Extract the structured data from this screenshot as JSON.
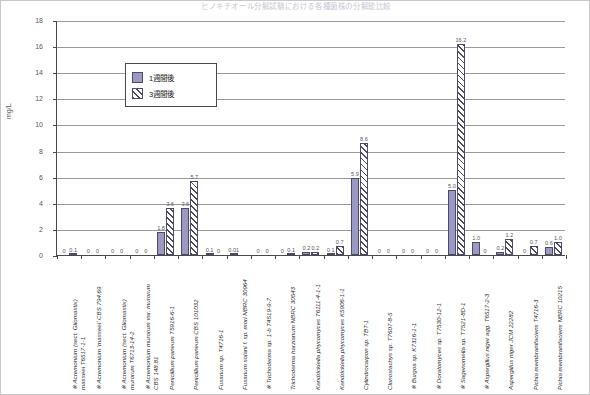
{
  "chart": {
    "title": "ヒノキチオール分解試験における各種菌株の分解能比較",
    "ylabel": "mg/L",
    "legend": [
      {
        "key": "week1",
        "label": "1週間後"
      },
      {
        "key": "week3",
        "label": "3週間後"
      }
    ]
  },
  "chart_data": {
    "type": "bar",
    "title": "ヒノキチオール分解試験における各種菌株の分解能比較",
    "xlabel": "",
    "ylabel": "mg/L",
    "ylim": [
      0,
      18
    ],
    "yticks": [
      0,
      2,
      4,
      6,
      8,
      10,
      12,
      14,
      16,
      18
    ],
    "grid": true,
    "legend_position": "upper-left-inside",
    "categories": [
      "※ Acremonium (sect. Gliomastix) masseei T6517-1-1",
      "※ Acremonium 'masseei' CBS 794.69",
      "※ Acremonium (sect. Gliomastix) murorum T6713-14-2",
      "※ Acremonium murorum var. murorum CBS 148.81",
      "Penicillium paneum T5916-6-1",
      "Penicillium paneum CBS 101032",
      "Fusarium sp. T4716-1",
      "Fusarium solani f. sp. mori NBRC 30964",
      "※ Trichoderma sp. 1-b T4519-9-7",
      "Trichoderma harzianum NBRC 30543",
      "Kendrickiella phycomyces T6111-4-1-1",
      "Kendrickiella phycomyces K5906-1-1",
      "Cylindrocarpon sp. TBT-1",
      "Clonostachys sp. T7607-8-5",
      "※ Burgoa sp. K7316-1-1",
      "※ Doratomyces sp. T7530-12-1",
      "※ Sagenomella sp. T7521-8D-1",
      "※ Aspergillus niger agg. T6517-2-3",
      "Aspergillus niger JCM 22282",
      "Pichia membranifaciens T4716-3",
      "Pichia membranifaciens NBRC 10215"
    ],
    "categories_display": [
      [
        "※ Acremonium (sect. Gliomastix)",
        "masseei T6517-1-1"
      ],
      [
        "※ Acremonium 'masseei' CBS 794.69"
      ],
      [
        "※ Acremonium (sect. Gliomastix)",
        "murorum T6713-14-2"
      ],
      [
        "※ Acremonium murorum var. murorum",
        "CBS 148.81"
      ],
      [
        "Penicillium paneum T5916-6-1"
      ],
      [
        "Penicillium paneum CBS 101032"
      ],
      [
        "Fusarium sp. T4716-1"
      ],
      [
        "Fusarium solani f. sp. mori NBRC 30964"
      ],
      [
        "※ Trichoderma sp. 1-b T4519-9-7"
      ],
      [
        "Trichoderma harzianum NBRC 30543"
      ],
      [
        "Kendrickiella phycomyces T6111-4-1-1"
      ],
      [
        "Kendrickiella phycomyces K5906-1-1"
      ],
      [
        "Cylindrocarpon sp. TBT-1"
      ],
      [
        "Clonostachys sp. T7607-8-5"
      ],
      [
        "※ Burgoa sp. K7316-1-1"
      ],
      [
        "※ Doratomyces sp. T7530-12-1"
      ],
      [
        "※ Sagenomella sp. T7521-8D-1"
      ],
      [
        "※ Aspergillus niger agg. T6517-2-3"
      ],
      [
        "Aspergillus niger JCM 22282"
      ],
      [
        "Pichia membranifaciens T4716-3"
      ],
      [
        "Pichia membranifaciens NBRC 10215"
      ]
    ],
    "series": [
      {
        "name": "1週間後",
        "color": "#9b98c4",
        "values": [
          0,
          0,
          0,
          0,
          1.8,
          3.6,
          0.1,
          0.1,
          0,
          0,
          0,
          0.2,
          0.1,
          5.9,
          0,
          0,
          5.0,
          1.0,
          0.2,
          0,
          0.6
        ],
        "labels": [
          "0",
          "0",
          "0",
          "0",
          "1.8",
          "3.6",
          "0.1",
          "0.01",
          "0",
          "0",
          "0.2",
          "0.1",
          "5.9",
          "0",
          "0",
          "5.0",
          "1.0",
          "0.2",
          "0",
          "0.6",
          ""
        ]
      },
      {
        "name": "3週間後",
        "color": "#4c4a68",
        "values": [
          0.1,
          0,
          0,
          0,
          3.6,
          5.7,
          0,
          0,
          0,
          0.1,
          0.2,
          0.7,
          8.6,
          0,
          0,
          16.2,
          0,
          1.2,
          0.7,
          1.0,
          0
        ],
        "labels": [
          "0.1",
          "0",
          "0",
          "0",
          "3.6",
          "5.7",
          "0",
          "0",
          "0.01",
          "0.1",
          "0.2",
          "0.7",
          "8.6",
          "0",
          "0",
          "16.2",
          "0",
          "1.2",
          "0.7",
          "1.0",
          ""
        ]
      }
    ],
    "points": [
      {
        "category": "※ Acremonium (sect. Gliomastix) masseei T6517-1-1",
        "week1": 0,
        "week1_label": "0",
        "week3": 0.1,
        "week3_label": "0.1"
      },
      {
        "category": "※ Acremonium 'masseei' CBS 794.69",
        "week1": 0,
        "week1_label": "0",
        "week3": 0,
        "week3_label": "0"
      },
      {
        "category": "※ Acremonium (sect. Gliomastix) murorum T6713-14-2",
        "week1": 0,
        "week1_label": "0",
        "week3": 0,
        "week3_label": "0"
      },
      {
        "category": "※ Acremonium murorum var. murorum CBS 148.81",
        "week1": 0,
        "week1_label": "0",
        "week3": 0,
        "week3_label": "0"
      },
      {
        "category": "Penicillium paneum T5916-6-1",
        "week1": 1.8,
        "week1_label": "1.8",
        "week3": 3.6,
        "week3_label": "3.6"
      },
      {
        "category": "Penicillium paneum CBS 101032",
        "week1": 3.6,
        "week1_label": "3.6",
        "week3": 5.7,
        "week3_label": "5.7"
      },
      {
        "category": "Fusarium sp. T4716-1",
        "week1": 0.1,
        "week1_label": "0.1",
        "week3": 0,
        "week3_label": "0"
      },
      {
        "category": "Fusarium solani f. sp. mori NBRC 30964",
        "week1": 0.01,
        "week1_label": "0.01",
        "week3": 0,
        "week3_label": ""
      },
      {
        "category": "※ Trichoderma sp. 1-b T4519-9-7",
        "week1": 0,
        "week1_label": "0",
        "week3": 0,
        "week3_label": "0"
      },
      {
        "category": "Trichoderma harzianum NBRC 30543",
        "week1": 0,
        "week1_label": "0",
        "week3": 0.1,
        "week3_label": "0.1"
      },
      {
        "category": "Kendrickiella phycomyces T6111-4-1-1",
        "week1": 0.2,
        "week1_label": "0.2",
        "week3": 0.2,
        "week3_label": "0.2"
      },
      {
        "category": "Kendrickiella phycomyces K5906-1-1",
        "week1": 0.1,
        "week1_label": "0.1",
        "week3": 0.7,
        "week3_label": "0.7"
      },
      {
        "category": "Cylindrocarpon sp. TBT-1",
        "week1": 5.9,
        "week1_label": "5.9",
        "week3": 8.6,
        "week3_label": "8.6"
      },
      {
        "category": "Clonostachys sp. T7607-8-5",
        "week1": 0,
        "week1_label": "0",
        "week3": 0,
        "week3_label": "0"
      },
      {
        "category": "※ Burgoa sp. K7316-1-1",
        "week1": 0,
        "week1_label": "0",
        "week3": 0,
        "week3_label": "0"
      },
      {
        "category": "※ Doratomyces sp. T7530-12-1",
        "week1": 0,
        "week1_label": "0",
        "week3": 0,
        "week3_label": "0"
      },
      {
        "category": "※ Sagenomella sp. T7521-8D-1",
        "week1": 5.0,
        "week1_label": "5.0",
        "week3": 16.2,
        "week3_label": "16.2"
      },
      {
        "category": "※ Aspergillus niger agg. T6517-2-3",
        "week1": 1.0,
        "week1_label": "1.0",
        "week3": 0,
        "week3_label": "0"
      },
      {
        "category": "Aspergillus niger JCM 22282",
        "week1": 0.2,
        "week1_label": "0.2",
        "week3": 1.2,
        "week3_label": "1.2"
      },
      {
        "category": "Pichia membranifaciens T4716-3",
        "week1": 0,
        "week1_label": "0",
        "week3": 0.7,
        "week3_label": "0.7"
      },
      {
        "category": "Pichia membranifaciens NBRC 10215",
        "week1": 0.6,
        "week1_label": "0.6",
        "week3": 1.0,
        "week3_label": "1.0"
      }
    ]
  }
}
